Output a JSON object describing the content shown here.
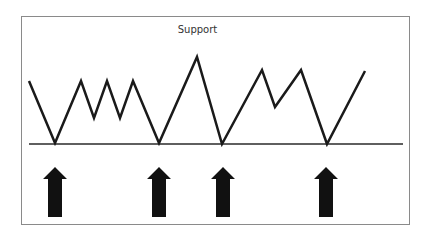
{
  "diagram": {
    "title": "Support",
    "colors": {
      "line": "#1a1a1a",
      "support": "#2a2a2a",
      "arrow": "#111111",
      "frame": "#8a8a8a"
    },
    "price_path": [
      [
        29,
        81
      ],
      [
        55,
        143
      ],
      [
        81,
        81
      ],
      [
        94,
        118
      ],
      [
        107,
        81
      ],
      [
        120,
        118
      ],
      [
        133,
        81
      ],
      [
        159,
        143
      ],
      [
        197,
        57
      ],
      [
        222,
        144
      ],
      [
        262,
        70
      ],
      [
        275,
        107
      ],
      [
        301,
        70
      ],
      [
        327,
        144
      ],
      [
        365,
        71
      ]
    ],
    "support_line": {
      "x1": 29,
      "x2": 403,
      "y": 144
    },
    "arrows": [
      {
        "x": 55,
        "label": "support-touch-1"
      },
      {
        "x": 159,
        "label": "support-touch-2"
      },
      {
        "x": 223,
        "label": "support-touch-3"
      },
      {
        "x": 326,
        "label": "support-touch-4"
      }
    ]
  }
}
